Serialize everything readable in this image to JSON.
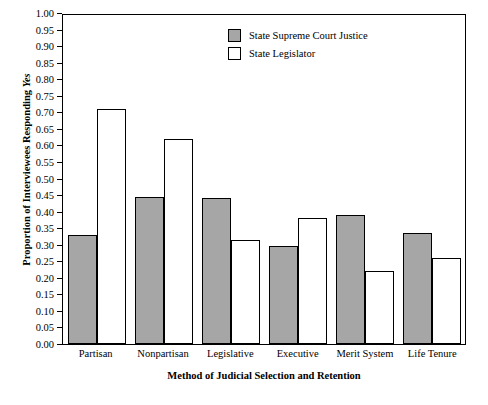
{
  "chart_data": {
    "type": "bar",
    "title": "",
    "xlabel": "Method of Judicial Selection and Retention",
    "ylabel_plain": "Proportion of Interviewees Responding ",
    "ylabel_italic": "Yes",
    "categories": [
      "Partisan",
      "Nonpartisan",
      "Legislative",
      "Executive",
      "Merit System",
      "Life Tenure"
    ],
    "series": [
      {
        "name": "State Supreme Court Justice",
        "style": "filled",
        "color": "#a6a6a6",
        "values": [
          0.33,
          0.445,
          0.44,
          0.295,
          0.39,
          0.335
        ]
      },
      {
        "name": "State Legislator",
        "style": "hollow",
        "color": "#ffffff",
        "values": [
          0.71,
          0.62,
          0.315,
          0.38,
          0.22,
          0.26
        ]
      }
    ],
    "ylim": [
      0.0,
      1.0
    ],
    "ytick_step": 0.05,
    "yticks": [
      "1.00",
      "0.95",
      "0.90",
      "0.85",
      "0.80",
      "0.75",
      "0.70",
      "0.65",
      "0.60",
      "0.55",
      "0.50",
      "0.45",
      "0.40",
      "0.35",
      "0.30",
      "0.25",
      "0.20",
      "0.15",
      "0.10",
      "0.05",
      "0.00"
    ],
    "grid": false,
    "legend_position": "top-right"
  }
}
